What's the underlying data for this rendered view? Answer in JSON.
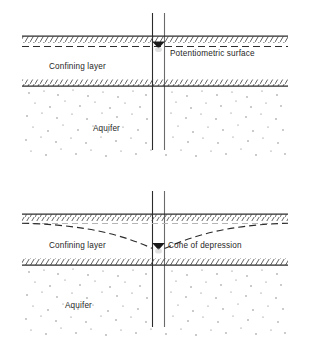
{
  "figure": {
    "colors": {
      "ink": "#1a1a1a",
      "line": "#2b2b2b",
      "stipple": "#6e6e6e",
      "reference_line": "#b5b5b5",
      "background": "#ffffff"
    }
  },
  "panels": [
    {
      "id": "static-conditions",
      "name": "Static potentiometric surface",
      "labels": {
        "confining_layer": "Confining layer",
        "aquifer": "Aquifer",
        "potentiometric_surface": "Potentiometric surface"
      },
      "features": {
        "well": "well-casing",
        "water_level_marker": "water-level-triangle",
        "potentiometric_surface_shape": "horizontal dashed line",
        "cone_of_depression": false
      }
    },
    {
      "id": "pumping-conditions",
      "name": "Drawdown with cone of depression",
      "labels": {
        "confining_layer": "Confining layer",
        "aquifer": "Aquifer",
        "cone_of_depression": "Cone of depression"
      },
      "features": {
        "well": "well-casing",
        "water_level_marker": "water-level-triangle",
        "potentiometric_surface_shape": "curve dipping toward well",
        "cone_of_depression": true,
        "original_surface_reference": "light gray dashed line"
      }
    }
  ]
}
